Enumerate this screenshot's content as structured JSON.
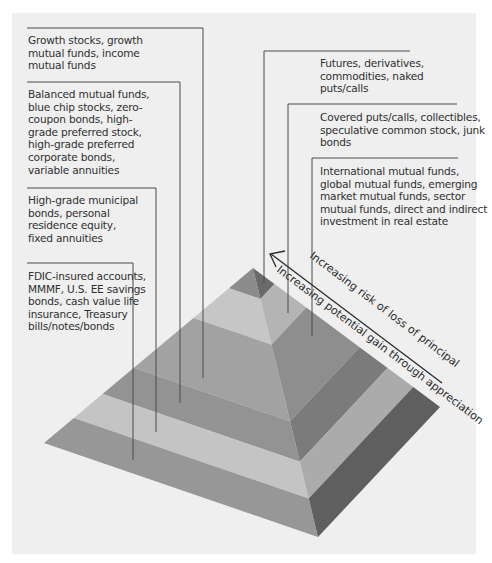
{
  "diagram": {
    "type": "investment-risk-pyramid",
    "tiers_bottom_to_top": [
      {
        "id": "tier-1",
        "label": "FDIC-insured accounts, MMMF, U.S. EE savings bonds, cash value life insurance, Treasury bills/notes/bonds",
        "side": "left"
      },
      {
        "id": "tier-2",
        "label": "High-grade municipal bonds, personal residence equity, fixed annuities",
        "side": "left"
      },
      {
        "id": "tier-3",
        "label": "Balanced mutual funds, blue chip stocks, zero-coupon bonds, high-grade preferred stock, high-grade preferred corporate bonds, variable annuities",
        "side": "left"
      },
      {
        "id": "tier-4",
        "label": "Growth stocks, growth mutual funds, income mutual funds",
        "side": "left"
      },
      {
        "id": "tier-5",
        "label": "International mutual funds, global mutual funds, emerging market mutual funds, sector mutual funds, direct and indirect investment in real estate",
        "side": "right"
      },
      {
        "id": "tier-6",
        "label": "Covered puts/calls, collectibles, speculative common stock, junk bonds",
        "side": "right"
      },
      {
        "id": "tier-7",
        "label": "Futures, derivatives, commodities, naked puts/calls",
        "side": "right"
      }
    ],
    "labels": {
      "growth": "Growth stocks, growth\nmutual funds, income\nmutual funds",
      "balanced": "Balanced mutual funds,\nblue chip stocks, zero-\ncoupon bonds, high-\ngrade preferred stock,\nhigh-grade preferred\ncorporate bonds,\nvariable annuities",
      "municipal": "High-grade municipal\nbonds, personal\nresidence equity,\nfixed annuities",
      "fdic": "FDIC-insured accounts,\nMMMF, U.S. EE savings\nbonds, cash value life\ninsurance, Treasury\nbills/notes/bonds",
      "futures": "Futures, derivatives,\ncommodities, naked\nputs/calls",
      "covered": "Covered puts/calls, collectibles,\nspeculative common stock, junk\nbonds",
      "international": "International mutual funds,\nglobal mutual funds, emerging\nmarket mutual funds, sector\nmutual funds, direct and indirect\ninvestment in real estate"
    },
    "arrow": {
      "risk_label": "Increasing risk of loss of principal",
      "gain_label": "Increasing potential gain through appreciation",
      "direction": "toward-apex"
    },
    "colors": {
      "panel": "#efefef",
      "line": "#4a4a4a",
      "left_face": [
        "#8c8c8c",
        "#c6c6c6",
        "#a2a2a2",
        "#939393",
        "#c4c4c4",
        "#979797"
      ],
      "right_face": [
        "#6a6a6a",
        "#b4b4b4",
        "#8e8e8e",
        "#7b7b7b",
        "#ababab",
        "#5f5f5f"
      ]
    }
  }
}
